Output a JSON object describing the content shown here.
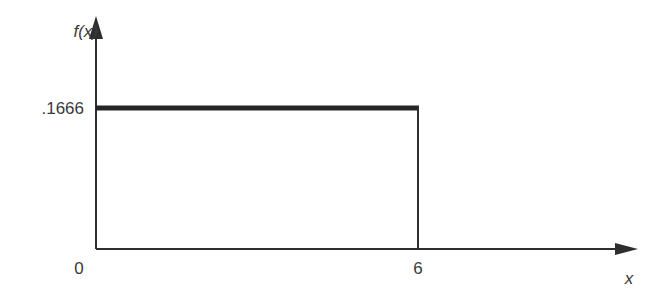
{
  "chart_data": {
    "type": "line",
    "title": "",
    "xlabel": "x",
    "ylabel": "f(x)",
    "x_ticks": [
      "0",
      "6"
    ],
    "y_ticks": [
      ".1666"
    ],
    "xlim": [
      0,
      10
    ],
    "ylim": [
      0,
      0.25
    ],
    "grid": false,
    "legend": "none",
    "series": [
      {
        "name": "uniform density",
        "x": [
          0,
          6,
          6
        ],
        "y": [
          0.1666,
          0.1666,
          0
        ],
        "emphasis": "thick horizontal segment at f(x)=.1666 from x=0 to x=6, thin vertical drop at x=6"
      }
    ]
  }
}
